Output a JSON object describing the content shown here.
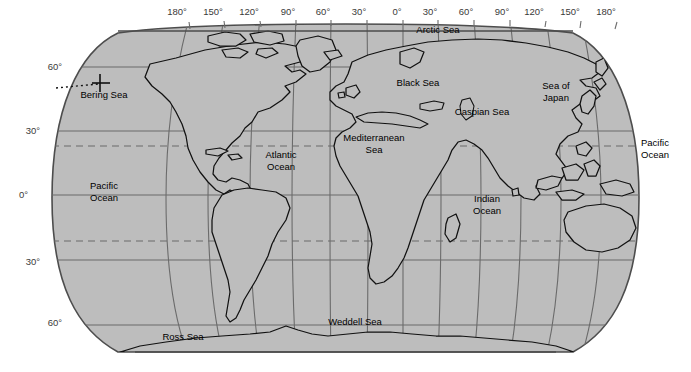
{
  "map": {
    "title": "World Ocean Map",
    "projection": "robinson",
    "fill_color": "#bdbdbd",
    "outline_color": "#4d4d4d",
    "coastline_color": "#111111",
    "grid_color": "#6b6b6b",
    "tropic_color": "#6b6b6b",
    "label_color": "#3a3a3a",
    "background": "#ffffff",
    "longitude_labels": [
      {
        "text": "180°",
        "x": 177,
        "y": 15
      },
      {
        "text": "150°",
        "x": 213,
        "y": 15
      },
      {
        "text": "120°",
        "x": 249,
        "y": 15
      },
      {
        "text": "90°",
        "x": 288,
        "y": 15
      },
      {
        "text": "60°",
        "x": 323,
        "y": 15
      },
      {
        "text": "30°",
        "x": 359,
        "y": 15
      },
      {
        "text": "0°",
        "x": 397,
        "y": 15
      },
      {
        "text": "30°",
        "x": 430,
        "y": 15
      },
      {
        "text": "60°",
        "x": 466,
        "y": 15
      },
      {
        "text": "90°",
        "x": 502,
        "y": 15
      },
      {
        "text": "120°",
        "x": 534,
        "y": 15
      },
      {
        "text": "150°",
        "x": 570,
        "y": 15
      },
      {
        "text": "180°",
        "x": 606,
        "y": 15
      }
    ],
    "latitude_labels_left": [
      {
        "text": "60°",
        "x": 62,
        "y": 70
      },
      {
        "text": "30°",
        "x": 40,
        "y": 134
      },
      {
        "text": "0°",
        "x": 48,
        "y": 198
      },
      {
        "text": "30°",
        "x": 40,
        "y": 265
      },
      {
        "text": "60°",
        "x": 62,
        "y": 326
      }
    ],
    "ocean_labels": [
      {
        "name": "pacific-ocean-west",
        "lines": [
          "Pacific",
          "Ocean"
        ],
        "x": 104,
        "y": 189
      },
      {
        "name": "pacific-ocean-east",
        "lines": [
          "Pacific",
          "Ocean"
        ],
        "x": 655,
        "y": 146
      },
      {
        "name": "atlantic-ocean",
        "lines": [
          "Atlantic",
          "Ocean"
        ],
        "x": 281,
        "y": 158
      },
      {
        "name": "indian-ocean",
        "lines": [
          "Indian",
          "Ocean"
        ],
        "x": 487,
        "y": 202
      },
      {
        "name": "mediterranean-sea",
        "lines": [
          "Mediterranean",
          "Sea"
        ],
        "x": 374,
        "y": 141
      },
      {
        "name": "arctic-sea",
        "lines": [
          "Arctic Sea"
        ],
        "x": 438,
        "y": 33
      },
      {
        "name": "black-sea",
        "lines": [
          "Black Sea"
        ],
        "x": 418,
        "y": 86
      },
      {
        "name": "caspian-sea",
        "lines": [
          "Caspian Sea"
        ],
        "x": 482,
        "y": 115
      },
      {
        "name": "sea-of-japan",
        "lines": [
          "Sea of",
          "Japan"
        ],
        "x": 556,
        "y": 89
      },
      {
        "name": "bering-sea",
        "lines": [
          "Bering Sea"
        ],
        "x": 104,
        "y": 98
      },
      {
        "name": "ross-sea",
        "lines": [
          "Ross Sea"
        ],
        "x": 183,
        "y": 340
      },
      {
        "name": "weddell-sea",
        "lines": [
          "Weddell Sea"
        ],
        "x": 355,
        "y": 325
      }
    ],
    "graticule": {
      "meridian_interval_deg": 30,
      "parallel_solid_deg": [
        60,
        30,
        0,
        -30,
        -60
      ],
      "parallel_dashed_deg": [
        23.5,
        -23.5
      ],
      "dashed_label": "Tropics"
    }
  }
}
